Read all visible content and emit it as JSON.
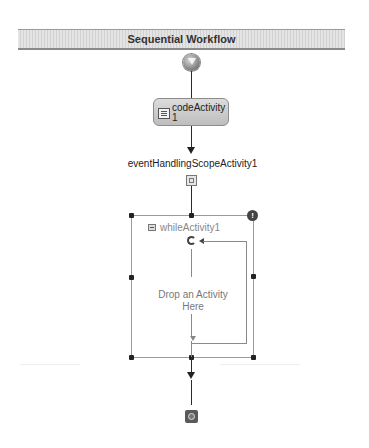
{
  "designer": {
    "title": "Sequential Workflow"
  },
  "activities": {
    "start": {
      "icon": "start-arrow-icon"
    },
    "code_activity": {
      "label": "codeActivity 1",
      "icon": "code-activity-icon"
    },
    "event_handling_scope": {
      "label": "eventHandlingScopeActivity1",
      "icon": "event-handlers-view-icon"
    },
    "while_activity": {
      "label": "whileActivity1",
      "collapse_icon": "collapse-icon",
      "warning_icon": "warning-icon",
      "warning_glyph": "!",
      "loop_icon": "loop-icon",
      "drop_placeholder": "Drop an Activity Here"
    },
    "end": {
      "icon": "end-stop-icon"
    }
  },
  "colors": {
    "connector": "#2a2a2a",
    "activity_fill": "#c8c8c8",
    "placeholder_text": "#777777"
  }
}
